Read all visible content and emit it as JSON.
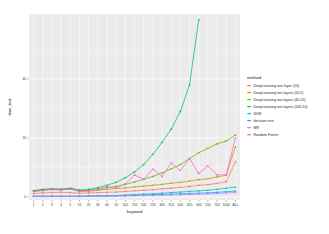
{
  "chart_data": {
    "type": "line",
    "title": "",
    "xlabel": "keyword",
    "ylabel": "time_test",
    "grid": true,
    "legend_position": "right",
    "legend_title": "method",
    "panel_background": "#ebebeb",
    "grid_color": "#ffffff",
    "categories": [
      "1",
      "2",
      "3",
      "4",
      "5",
      "10",
      "20",
      "30",
      "40",
      "50",
      "100",
      "150",
      "200",
      "250",
      "300",
      "350",
      "400",
      "450",
      "500",
      "550",
      "700",
      "1000",
      "ALL"
    ],
    "x_tick_labels": [
      "1",
      "2",
      "3",
      "4",
      "5",
      "10",
      "20",
      "30",
      "40",
      "50",
      "100",
      "150",
      "200",
      "250",
      "300",
      "350",
      "400",
      "450",
      "500",
      "550",
      "700",
      "1000",
      "ALL"
    ],
    "y_tick_labels": [
      "0",
      "20",
      "40"
    ],
    "y_ticks": [
      0,
      20,
      40
    ],
    "ylim": [
      -1,
      62
    ],
    "series": [
      {
        "name": "DeepLearning one layer (10)",
        "color": "#f8766d",
        "values": [
          1.2,
          1.4,
          1.5,
          1.6,
          1.5,
          1.3,
          1.4,
          1.5,
          1.6,
          1.7,
          1.9,
          2.1,
          2.3,
          2.5,
          2.8,
          3.0,
          3.3,
          3.6,
          4.0,
          4.2,
          4.6,
          5.2,
          12.0
        ]
      },
      {
        "name": "DeepLearning two layers (10,5)",
        "color": "#cd9600",
        "values": [
          2.0,
          2.4,
          2.6,
          2.5,
          2.8,
          2.0,
          2.1,
          2.3,
          2.6,
          2.9,
          3.1,
          3.4,
          3.7,
          4.0,
          4.3,
          4.7,
          5.0,
          5.4,
          5.9,
          6.2,
          6.8,
          7.4,
          17.0
        ]
      },
      {
        "name": "DeepLearning two layers (40,10)",
        "color": "#7cae00",
        "values": [
          2.1,
          2.5,
          2.7,
          2.6,
          2.9,
          2.2,
          2.3,
          2.8,
          3.2,
          3.6,
          4.3,
          5.1,
          6.0,
          7.0,
          8.2,
          9.5,
          11.0,
          13.0,
          15.0,
          16.5,
          18.0,
          19.0,
          21.0
        ]
      },
      {
        "name": "DeepLearning two layers (100,10)",
        "color": "#00be67",
        "values": [
          2.2,
          2.6,
          2.8,
          2.7,
          3.0,
          2.4,
          2.6,
          3.2,
          4.0,
          5.0,
          6.5,
          8.5,
          11.0,
          14.5,
          18.5,
          23.0,
          29.0,
          38.0,
          60.0,
          null,
          null,
          null,
          null
        ]
      },
      {
        "name": "SVM",
        "color": "#00bfc4",
        "values": [
          0.3,
          0.3,
          0.3,
          0.3,
          0.3,
          0.3,
          0.4,
          0.4,
          0.5,
          0.5,
          0.7,
          0.8,
          1.0,
          1.1,
          1.3,
          1.5,
          1.7,
          1.9,
          2.1,
          2.3,
          2.6,
          3.0,
          3.4
        ]
      },
      {
        "name": "decision tree",
        "color": "#00a9ff",
        "values": [
          0.25,
          0.25,
          0.25,
          0.25,
          0.25,
          0.25,
          0.3,
          0.3,
          0.35,
          0.4,
          0.5,
          0.6,
          0.7,
          0.8,
          0.9,
          1.0,
          1.1,
          1.2,
          1.3,
          1.4,
          1.6,
          1.8,
          2.0
        ]
      },
      {
        "name": "MR",
        "color": "#c77cff",
        "values": [
          0.2,
          0.2,
          0.2,
          0.2,
          0.2,
          0.2,
          0.25,
          0.25,
          0.3,
          0.3,
          0.4,
          0.45,
          0.5,
          0.55,
          0.6,
          0.7,
          0.8,
          0.9,
          1.0,
          1.1,
          1.2,
          1.4,
          1.6
        ]
      },
      {
        "name": "Random Forest",
        "color": "#ff61cc",
        "values": [
          1.8,
          2.2,
          2.5,
          2.4,
          2.7,
          1.9,
          2.0,
          2.3,
          3.5,
          3.0,
          4.5,
          7.5,
          6.0,
          9.5,
          7.0,
          11.5,
          9.0,
          13.0,
          8.0,
          10.5,
          7.5,
          7.5,
          20.0
        ]
      }
    ]
  }
}
